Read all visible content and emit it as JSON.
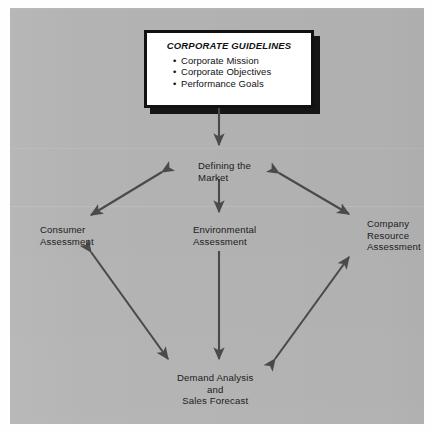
{
  "figure": {
    "background_color": "#b3b3b3",
    "ink_color": "#4a4a4a"
  },
  "guidelines_box": {
    "title": "CORPORATE GUIDELINES",
    "bullet_glyph": "•",
    "items": [
      "Corporate Mission",
      "Corporate Objectives",
      "Performance Goals"
    ]
  },
  "nodes": {
    "defining_market": {
      "lines": [
        "Defining the",
        "Market"
      ]
    },
    "consumer_assessment": {
      "lines": [
        "Consumer",
        "Assessment"
      ]
    },
    "environmental_assessment": {
      "lines": [
        "Environmental",
        "Assessment"
      ]
    },
    "company_resource_assessment": {
      "lines": [
        "Company",
        "Resource",
        "Assessment"
      ]
    },
    "demand_analysis": {
      "lines": [
        "Demand Analysis",
        "and",
        "Sales Forecast"
      ]
    }
  },
  "connectors": [
    {
      "name": "guidelines-to-defining-market",
      "from": "Corporate Guidelines",
      "to": "Defining the Market",
      "style": "single-headed",
      "direction": "down"
    },
    {
      "name": "defining-market-to-consumer-assessment",
      "from": "Defining the Market",
      "to": "Consumer Assessment",
      "style": "double-headed",
      "direction": "diagonal-down-left"
    },
    {
      "name": "defining-market-to-environmental-assessment",
      "from": "Defining the Market",
      "to": "Environmental Assessment",
      "style": "single-headed",
      "direction": "down"
    },
    {
      "name": "defining-market-to-company-resource-assessment",
      "from": "Defining the Market",
      "to": "Company Resource Assessment",
      "style": "double-headed",
      "direction": "diagonal-down-right"
    },
    {
      "name": "consumer-assessment-to-demand-analysis",
      "from": "Consumer Assessment",
      "to": "Demand Analysis and Sales Forecast",
      "style": "double-headed",
      "direction": "diagonal-down-right"
    },
    {
      "name": "environmental-assessment-to-demand-analysis",
      "from": "Environmental Assessment",
      "to": "Demand Analysis and Sales Forecast",
      "style": "single-headed",
      "direction": "down"
    },
    {
      "name": "company-resource-assessment-to-demand-analysis",
      "from": "Company Resource Assessment",
      "to": "Demand Analysis and Sales Forecast",
      "style": "double-headed",
      "direction": "diagonal-down-left"
    }
  ]
}
